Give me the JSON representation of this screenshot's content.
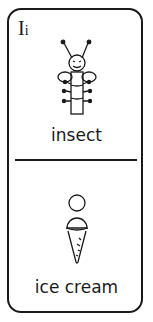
{
  "card": {
    "letter_upper": "I",
    "letter_lower": "i",
    "top": {
      "word": "insect",
      "icon": "insect-icon"
    },
    "bottom": {
      "word": "ice cream",
      "icon": "ice-cream-icon"
    }
  },
  "colors": {
    "ink": "#1a1a1a",
    "background": "#ffffff"
  }
}
